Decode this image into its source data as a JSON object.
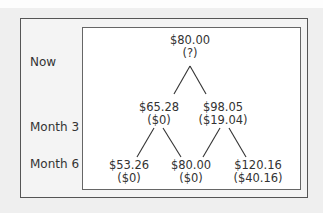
{
  "diagram": {
    "type": "binomial-tree",
    "row_labels": [
      "Now",
      "Month 3",
      "Month 6"
    ],
    "nodes": {
      "now": {
        "price": "$80.00",
        "value": "(?)"
      },
      "m3_down": {
        "price": "$65.28",
        "value": "($0)"
      },
      "m3_up": {
        "price": "$98.05",
        "value": "($19.04)"
      },
      "m6_dd": {
        "price": "$53.26",
        "value": "($0)"
      },
      "m6_ud": {
        "price": "$80.00",
        "value": "($0)"
      },
      "m6_uu": {
        "price": "$120.16",
        "value": "($40.16)"
      }
    }
  }
}
